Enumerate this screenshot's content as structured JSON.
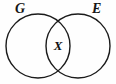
{
  "diagram": {
    "type": "venn",
    "title": "",
    "background_color": "#fefefe",
    "stroke_color": "#1a1a1a",
    "stroke_width": 1.4,
    "sets": [
      {
        "id": "left",
        "label": "G",
        "cx": 38,
        "cy": 46,
        "r": 32
      },
      {
        "id": "right",
        "label": "E",
        "cx": 78,
        "cy": 46,
        "r": 32
      }
    ],
    "intersection": {
      "label": "X",
      "cx": 58,
      "cy": 45
    }
  }
}
